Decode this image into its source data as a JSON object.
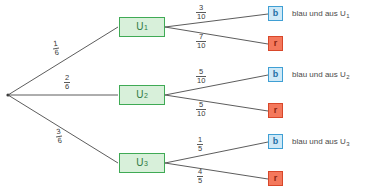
{
  "diagram": {
    "type": "probability-tree",
    "title": "",
    "root": {
      "label": ""
    },
    "stage1": [
      {
        "id": "U1",
        "label": "U",
        "subscript": "1",
        "probability": {
          "numerator": "1",
          "denominator": "6"
        }
      },
      {
        "id": "U2",
        "label": "U",
        "subscript": "2",
        "probability": {
          "numerator": "2",
          "denominator": "6"
        }
      },
      {
        "id": "U3",
        "label": "U",
        "subscript": "3",
        "probability": {
          "numerator": "3",
          "denominator": "6"
        }
      }
    ],
    "stage2": [
      {
        "parent": "U1",
        "branches": [
          {
            "outcome": "b",
            "kind": "blue",
            "probability": {
              "numerator": "3",
              "denominator": "10"
            },
            "description": "blau und aus U",
            "description_subscript": "1"
          },
          {
            "outcome": "r",
            "kind": "red",
            "probability": {
              "numerator": "7",
              "denominator": "10"
            },
            "description": "",
            "description_subscript": ""
          }
        ]
      },
      {
        "parent": "U2",
        "branches": [
          {
            "outcome": "b",
            "kind": "blue",
            "probability": {
              "numerator": "5",
              "denominator": "10"
            },
            "description": "blau und aus U",
            "description_subscript": "2"
          },
          {
            "outcome": "r",
            "kind": "red",
            "probability": {
              "numerator": "5",
              "denominator": "10"
            },
            "description": "",
            "description_subscript": ""
          }
        ]
      },
      {
        "parent": "U3",
        "branches": [
          {
            "outcome": "b",
            "kind": "blue",
            "probability": {
              "numerator": "1",
              "denominator": "5"
            },
            "description": "blau und aus U",
            "description_subscript": "3"
          },
          {
            "outcome": "r",
            "kind": "red",
            "probability": {
              "numerator": "4",
              "denominator": "5"
            },
            "description": "",
            "description_subscript": ""
          }
        ]
      }
    ],
    "colors": {
      "urn_fill": "#d8f0da",
      "urn_border": "#3faa55",
      "urn_text": "#2f7a42",
      "blue_fill": "#cfe9f7",
      "blue_border": "#3f9fd4",
      "blue_text": "#1f6fa5",
      "red_fill": "#f4785c",
      "red_border": "#d8472a",
      "red_text": "#8c2410",
      "edge": "#4a4a4a",
      "background": "#ffffff"
    }
  }
}
